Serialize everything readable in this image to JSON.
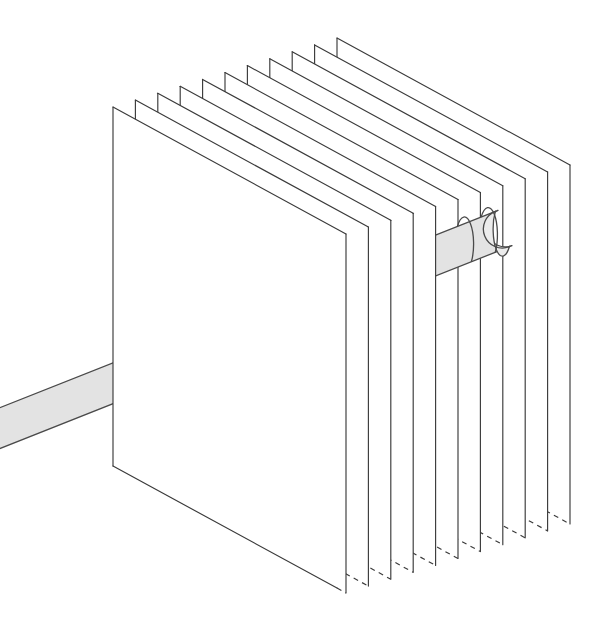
{
  "figure": {
    "background_color": "#ffffff",
    "line_color": "#3a3a3a",
    "rod_fill_color": "#e3e3e3",
    "rod_cap_color": "#ececec",
    "rod_stroke_color": "#4a4a4a"
  },
  "chart_data": {
    "type": "diagram",
    "xlabel": "",
    "ylabel": "",
    "grid": false,
    "legend": "none",
    "canvas": {
      "width": 611,
      "height": 627
    },
    "planes": {
      "count": 11,
      "front_left_top": [
        113,
        107
      ],
      "front_left_bottom": [
        113,
        466
      ],
      "plane_height_px": 359,
      "stack_step": [
        22.4,
        -6.9
      ],
      "depth_vector": [
        233,
        127
      ],
      "edge_style_front": "solid",
      "edge_style_hidden": "dashed",
      "stroke_width": 1.15
    },
    "rod": {
      "axis_start": [
        -10,
        432
      ],
      "axis_end": [
        505,
        228
      ],
      "radius_px": 19,
      "tip_shape": "rounded-hemispherical-cap",
      "seam_count": 2,
      "fill": "#e3e3e3"
    }
  },
  "planes": [
    {
      "index": 1,
      "label": "plane-1",
      "lx": 113.0,
      "ty": 107.0
    },
    {
      "index": 2,
      "label": "plane-2",
      "lx": 135.4,
      "ty": 100.1
    },
    {
      "index": 3,
      "label": "plane-3",
      "lx": 157.8,
      "ty": 93.2
    },
    {
      "index": 4,
      "label": "plane-4",
      "lx": 180.2,
      "ty": 86.3
    },
    {
      "index": 5,
      "label": "plane-5",
      "lx": 202.6,
      "ty": 79.4
    },
    {
      "index": 6,
      "label": "plane-6",
      "lx": 225.0,
      "ty": 72.5
    },
    {
      "index": 7,
      "label": "plane-7",
      "lx": 247.4,
      "ty": 65.6
    },
    {
      "index": 8,
      "label": "plane-8",
      "lx": 269.8,
      "ty": 58.7
    },
    {
      "index": 9,
      "label": "plane-9",
      "lx": 292.2,
      "ty": 51.8
    },
    {
      "index": 10,
      "label": "plane-10",
      "lx": 314.6,
      "ty": 44.9
    },
    {
      "index": 11,
      "label": "plane-11",
      "lx": 337.0,
      "ty": 38.0
    }
  ]
}
